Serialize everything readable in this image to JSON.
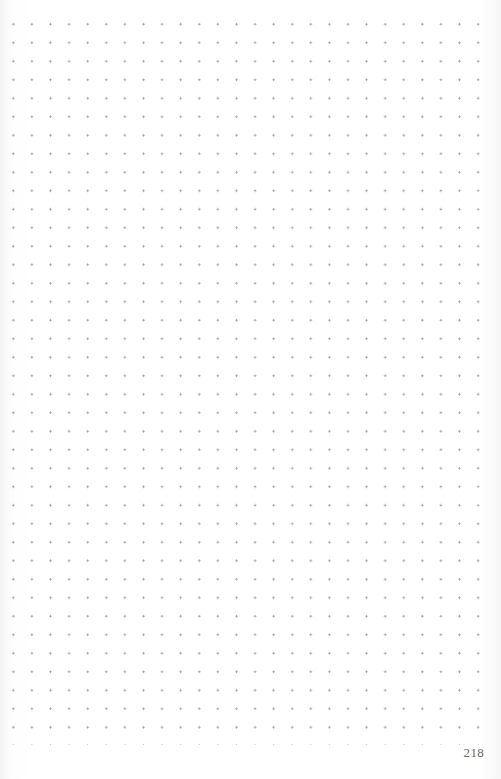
{
  "page": {
    "type": "dot-grid notebook page",
    "page_number": "218",
    "dot_color": "#a4a4a4",
    "background_color": "#ffffff"
  }
}
